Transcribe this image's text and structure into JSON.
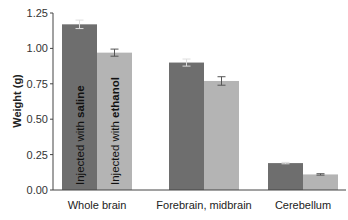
{
  "chart_data": {
    "type": "bar",
    "title": "",
    "xlabel": "",
    "ylabel": "Weight (g)",
    "ylim": [
      0,
      1.25
    ],
    "yticks": [
      "0.00",
      "0.25",
      "0.50",
      "0.75",
      "1.00",
      "1.25"
    ],
    "categories": [
      "Whole brain",
      "Forebrain, midbrain",
      "Cerebellum"
    ],
    "series": [
      {
        "name": "Injected with saline",
        "name_prefix": "Injected with ",
        "name_bold": "saline",
        "color": "#6e6e6e",
        "values": [
          1.17,
          0.9,
          0.19
        ],
        "errors": [
          0.03,
          0.025,
          0.005
        ]
      },
      {
        "name": "Injected with ethanol",
        "name_prefix": "Injected with ",
        "name_bold": "ethanol",
        "color": "#b4b4b4",
        "values": [
          0.97,
          0.77,
          0.11
        ],
        "errors": [
          0.025,
          0.03,
          0.005
        ]
      }
    ],
    "legend_position": "inside first category bars (vertical text)",
    "grid": false
  }
}
